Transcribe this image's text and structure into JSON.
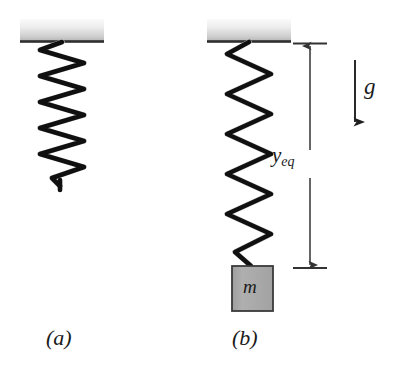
{
  "figure": {
    "caption_a": "(a)",
    "caption_b": "(b)",
    "background_color": "#ffffff"
  },
  "panel_a": {
    "name": "unstretched-spring",
    "ceiling": {
      "label": "",
      "fill_top": "#f2f2f2",
      "fill_bottom": "#b9b9b9",
      "edge_color": "#2b2b2b",
      "x": 20,
      "y": 19,
      "width": 84,
      "height": 23
    },
    "spring": {
      "coils": 11,
      "top_y": 42,
      "bottom_y": 186,
      "center_x": 62,
      "radius": 22,
      "wire_color": "#111111",
      "highlight_color": "#d8d8d8",
      "state": "relaxed"
    }
  },
  "panel_b": {
    "name": "stretched-spring-with-mass",
    "ceiling": {
      "fill_top": "#f2f2f2",
      "fill_bottom": "#b9b9b9",
      "edge_color": "#2b2b2b",
      "x": 207,
      "y": 19,
      "width": 84,
      "height": 23
    },
    "spring": {
      "coils": 11,
      "top_y": 42,
      "bottom_y": 266,
      "center_x": 249,
      "radius": 22,
      "wire_color": "#111111",
      "highlight_color": "#d8d8d8",
      "state": "stretched"
    },
    "mass_block": {
      "label": "m",
      "fill_color": "#a8a8a8",
      "border_color": "#3a3a3a",
      "x": 232,
      "y": 266,
      "width": 41,
      "height": 45
    }
  },
  "annotations": {
    "displacement": {
      "label": "y",
      "subscript": "eq",
      "line_x": 310,
      "top_y": 44,
      "bottom_y": 268,
      "tick_half_width": 17,
      "color": "#333333",
      "arrow_style": "double-headed"
    },
    "gravity": {
      "label": "g",
      "arrow_x": 355,
      "top_y": 60,
      "bottom_y": 126,
      "direction": "down",
      "color": "#1f1f1f"
    }
  }
}
